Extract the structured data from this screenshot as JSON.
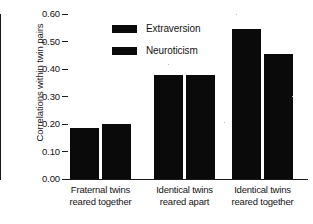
{
  "chart_data": {
    "type": "bar",
    "title": "",
    "xlabel": "",
    "ylabel": "Correlations within twin pairs",
    "ylim": [
      0.0,
      0.6
    ],
    "ytick_labels": [
      "0.60",
      "0.50",
      "0.40",
      "0.30",
      "0.20",
      "0.10",
      "0.00"
    ],
    "ytick_values": [
      0.6,
      0.5,
      0.4,
      0.3,
      0.2,
      0.1,
      0.0
    ],
    "grid": false,
    "legend_position": "upper-center-left",
    "categories": [
      "Fraternal twins reared together",
      "Identical twins reared apart",
      "Identical twins reared together"
    ],
    "category_lines": [
      [
        "Fraternal twins",
        "reared together"
      ],
      [
        "Identical twins",
        "reared apart"
      ],
      [
        "Identical twins",
        "reared together"
      ]
    ],
    "series": [
      {
        "name": "Extraversion",
        "color": "#0a0a0a",
        "values": [
          0.185,
          0.38,
          0.545
        ]
      },
      {
        "name": "Neuroticism",
        "color": "#0a0a0a",
        "values": [
          0.2,
          0.378,
          0.455
        ]
      }
    ]
  },
  "legend": {
    "items": [
      {
        "label": "Extraversion"
      },
      {
        "label": "Neuroticism"
      }
    ]
  },
  "axis": {
    "y_title": "Correlations within twin pairs"
  },
  "colors": {
    "bar": "#0a0a0a",
    "axis": "#1a1a1a",
    "text": "#141414",
    "background": "#ffffff"
  }
}
